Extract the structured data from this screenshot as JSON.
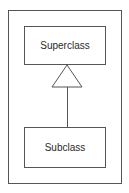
{
  "diagram": {
    "type": "uml-inheritance",
    "superclass": {
      "label": "Superclass"
    },
    "subclass": {
      "label": "Subclass"
    },
    "relationship": "generalization",
    "colors": {
      "stroke": "#555555",
      "text": "#2a2a2a",
      "background": "#ffffff"
    }
  }
}
